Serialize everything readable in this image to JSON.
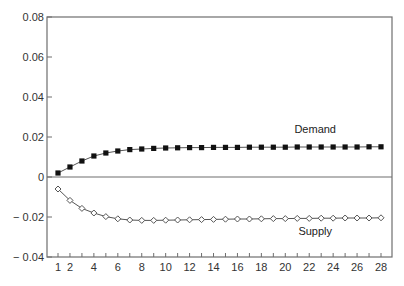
{
  "chart_data": {
    "type": "line",
    "title": "",
    "xlabel": "",
    "ylabel": "",
    "x": [
      1,
      2,
      3,
      4,
      5,
      6,
      7,
      8,
      9,
      10,
      11,
      12,
      13,
      14,
      15,
      16,
      17,
      18,
      19,
      20,
      21,
      22,
      23,
      24,
      25,
      26,
      27,
      28
    ],
    "x_tick_labels": [
      "1",
      "2",
      "4",
      "6",
      "8",
      "10",
      "12",
      "14",
      "16",
      "18",
      "20",
      "22",
      "24",
      "26",
      "28"
    ],
    "y_tick_labels": [
      "0.08",
      "0.06",
      "0.04",
      "0.02",
      "0",
      "-0.02",
      "-0.04"
    ],
    "xlim": [
      0,
      29
    ],
    "ylim": [
      -0.04,
      0.08
    ],
    "zero_line": true,
    "grid": false,
    "legend": "inline labels",
    "series": [
      {
        "name": "Demand",
        "marker": "filled-square",
        "values": [
          0.002,
          0.005,
          0.008,
          0.0105,
          0.012,
          0.013,
          0.0137,
          0.014,
          0.0143,
          0.0145,
          0.0146,
          0.0147,
          0.0147,
          0.0148,
          0.0148,
          0.0148,
          0.0149,
          0.0149,
          0.0149,
          0.0149,
          0.015,
          0.015,
          0.015,
          0.015,
          0.015,
          0.015,
          0.0151,
          0.0151
        ]
      },
      {
        "name": "Supply",
        "marker": "open-diamond",
        "values": [
          -0.006,
          -0.0117,
          -0.0157,
          -0.018,
          -0.0198,
          -0.0209,
          -0.0215,
          -0.0217,
          -0.0217,
          -0.0216,
          -0.0215,
          -0.0214,
          -0.0213,
          -0.0212,
          -0.0211,
          -0.021,
          -0.021,
          -0.0209,
          -0.0208,
          -0.0208,
          -0.0207,
          -0.0207,
          -0.0206,
          -0.0206,
          -0.0205,
          -0.0205,
          -0.0205,
          -0.0204
        ]
      }
    ],
    "annotations": [
      {
        "text": "Demand",
        "x": 22.5,
        "y": 0.022
      },
      {
        "text": "Supply",
        "x": 22.5,
        "y": -0.029
      }
    ]
  },
  "colors": {
    "axis": "#6e6e6e",
    "line": "#555555",
    "marker": "#111111"
  }
}
